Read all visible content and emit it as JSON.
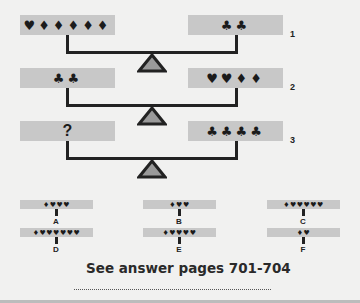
{
  "puzzle": {
    "balances": [
      {
        "number": "1",
        "left": "♥♦♦♦♦♦",
        "right": "♣♣"
      },
      {
        "number": "2",
        "left": "♣♣",
        "right": "♥♥♦♦"
      },
      {
        "number": "3",
        "left": "?",
        "right": "♣♣♣♣"
      }
    ],
    "options": [
      {
        "letter": "A",
        "symbols": "♦♥♥♥"
      },
      {
        "letter": "B",
        "symbols": "♦♥♥"
      },
      {
        "letter": "C",
        "symbols": "♦♥♥♥♥♥"
      },
      {
        "letter": "D",
        "symbols": "♦♥♥♥♥♥♥"
      },
      {
        "letter": "E",
        "symbols": "♦♥♥♥♥"
      },
      {
        "letter": "F",
        "symbols": "♦♥"
      }
    ],
    "answer_text": "See answer pages 701-704"
  },
  "colors": {
    "background": "#f1f1f0",
    "pan": "#c8c8c8",
    "line": "#222222",
    "fulcrum_fill": "#9a9a9a"
  }
}
